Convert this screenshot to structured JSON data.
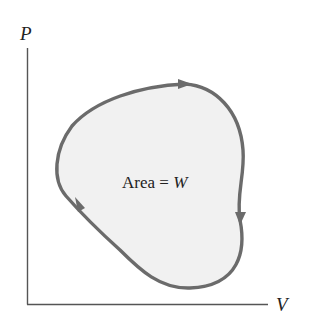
{
  "diagram": {
    "type": "pv-cycle",
    "axes": {
      "y_label": "P",
      "x_label": "V"
    },
    "area_label": {
      "prefix": "Area = ",
      "variable": "W"
    },
    "cycle_direction": "clockwise",
    "colors": {
      "curve": "#6b6b6b",
      "fill": "#f1f1f1",
      "axis": "#555555",
      "text": "#222222"
    }
  }
}
